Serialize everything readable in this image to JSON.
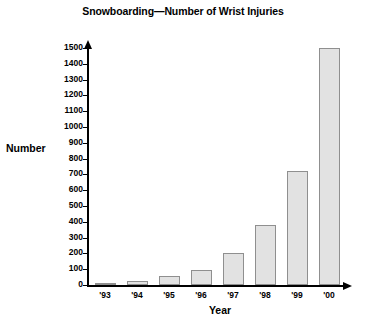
{
  "chart_data": {
    "type": "bar",
    "title": "Snowboarding—Number of Wrist Injuries",
    "xlabel": "Year",
    "ylabel": "Number",
    "categories": [
      "'93",
      "'94",
      "'95",
      "'96",
      "'97",
      "'98",
      "'99",
      "'00"
    ],
    "values": [
      10,
      25,
      55,
      95,
      200,
      380,
      720,
      1500
    ],
    "ylim": [
      0,
      1500
    ],
    "ytick_values": [
      0,
      100,
      200,
      300,
      400,
      500,
      600,
      700,
      800,
      900,
      1000,
      1100,
      1200,
      1300,
      1400,
      1500
    ],
    "ytick_labels": [
      "0",
      "100",
      "200",
      "300",
      "400",
      "500",
      "600",
      "700",
      "800",
      "900",
      "1000",
      "1100",
      "1200",
      "1300",
      "1400",
      "1500"
    ],
    "grid": false,
    "legend": null,
    "bar_fill_color": "#e2e2e2",
    "bar_border_color": "#8f8f8f",
    "axis_color": "#000000"
  }
}
